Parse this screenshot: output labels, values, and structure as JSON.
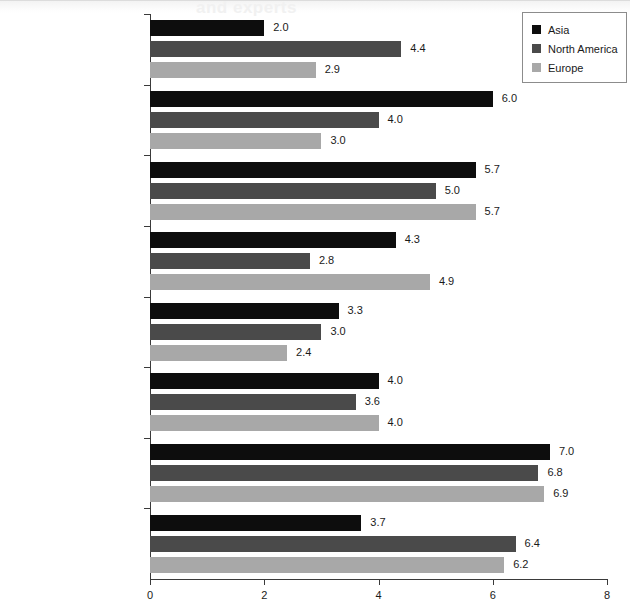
{
  "chart_data": {
    "type": "bar",
    "orientation": "horizontal",
    "title": "",
    "xlabel": "",
    "ylabel": "",
    "xlim": [
      0,
      8
    ],
    "xticks": [
      0,
      2,
      4,
      6,
      8
    ],
    "grid": false,
    "legend_position": "top-right",
    "categories": [
      "Infrastructure\nand support service",
      "Safety and security",
      "Cost",
      "Size of meeting facilities",
      "Reputation of destination",
      "Range of accommodations",
      "Appeal of destinations",
      "Access"
    ],
    "series": [
      {
        "name": "Asia",
        "color": "#0d0d0d",
        "values": [
          2.0,
          6.0,
          5.7,
          4.3,
          3.3,
          4.0,
          7.0,
          3.7
        ],
        "labels": [
          "2.0",
          "6.0",
          "5.7",
          "4.3",
          "3.3",
          "4.0",
          "7.0",
          "3.7"
        ]
      },
      {
        "name": "North America",
        "color": "#4a4a4a",
        "values": [
          4.4,
          4.0,
          5.0,
          2.8,
          3.0,
          3.6,
          6.8,
          6.4
        ],
        "labels": [
          "4.4",
          "4.0",
          "5.0",
          "2.8",
          "3.0",
          "3.6",
          "6.8",
          "6.4"
        ]
      },
      {
        "name": "Europe",
        "color": "#a8a8a8",
        "values": [
          2.9,
          3.0,
          5.7,
          4.9,
          2.4,
          4.0,
          6.9,
          6.2
        ],
        "labels": [
          "2.9",
          "3.0",
          "5.7",
          "4.9",
          "2.4",
          "4.0",
          "6.9",
          "6.2"
        ]
      }
    ]
  },
  "legend": {
    "items": [
      {
        "label": "Asia",
        "color": "#0d0d0d"
      },
      {
        "label": "North America",
        "color": "#4a4a4a"
      },
      {
        "label": "Europe",
        "color": "#a8a8a8"
      }
    ]
  },
  "axis": {
    "tick_labels": [
      "0",
      "2",
      "4",
      "6",
      "8"
    ]
  }
}
